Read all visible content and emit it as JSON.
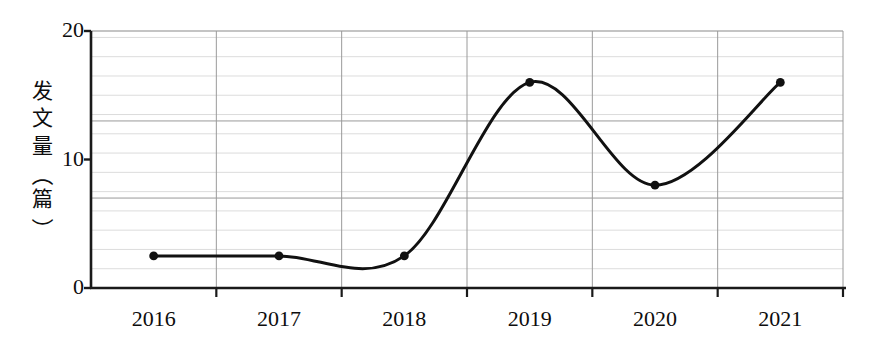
{
  "chart_data": {
    "type": "line",
    "title": "",
    "subtitle": "",
    "xlabel": "",
    "ylabel": "发文量（篇）",
    "categories": [
      "2016",
      "2017",
      "2018",
      "2019",
      "2020",
      "2021"
    ],
    "values": [
      2.5,
      2.5,
      2.5,
      16,
      8,
      16
    ],
    "series": [
      {
        "name": "发文量",
        "values": [
          2.5,
          2.5,
          2.5,
          16,
          8,
          16
        ]
      }
    ],
    "ylim": [
      0,
      20
    ],
    "yticks": [
      0,
      10,
      20
    ],
    "ytick_labels": [
      "0",
      "10",
      "20"
    ],
    "grid": true,
    "grid_minor_step": 1.5,
    "legend": "none",
    "smoothing": "spline",
    "marker": "circle",
    "line_color": "#111111",
    "marker_color": "#111111",
    "grid_color": "#d8d8d8",
    "axis_color": "#1a1a1a",
    "background": "#ffffff"
  },
  "axis": {
    "y_title_chars": [
      "发",
      "文",
      "量"
    ],
    "y_title_paren_open": "（",
    "y_title_paren_unit": "篇",
    "y_title_paren_close": "）"
  }
}
